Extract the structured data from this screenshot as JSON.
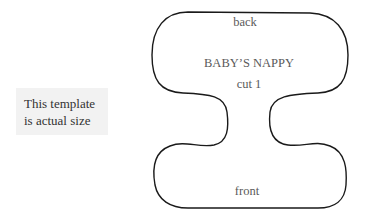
{
  "note": {
    "line1": "This template",
    "line2": "is actual size"
  },
  "template": {
    "shape": "nappy-outline",
    "labels": {
      "top": "back",
      "title": "BABY’S NAPPY",
      "instruction": "cut 1",
      "bottom": "front"
    },
    "outline_color": "#1a1a1a",
    "text_color": "#5a5a5a",
    "note_background": "#f2f2f2"
  }
}
